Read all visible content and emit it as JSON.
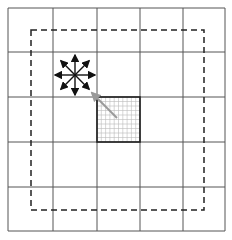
{
  "diagram": {
    "grid": {
      "rows": 5,
      "cols": 5,
      "x_lines": [
        8,
        53,
        97,
        140,
        183,
        225
      ],
      "y_lines": [
        8,
        52,
        97,
        142,
        187,
        231
      ],
      "line_color": "#555555"
    },
    "dashed_boundary": {
      "x1": 31,
      "y1": 30,
      "x2": 204,
      "y2": 210,
      "color": "#222222",
      "dash": "6,4"
    },
    "arrow_star": {
      "center": [
        75,
        75
      ],
      "length": 20,
      "directions": [
        "N",
        "NE",
        "E",
        "SE",
        "S",
        "SW",
        "W",
        "NW"
      ],
      "color": "#111111"
    },
    "highlighted_cell": {
      "row": 3,
      "col": 3,
      "x": 97,
      "y": 97,
      "w": 43,
      "h": 45,
      "subdivisions": 10,
      "subgrid_color": "#bbbbbb",
      "border_color": "#222222"
    },
    "pointer_arrow": {
      "from": [
        117,
        118
      ],
      "to": [
        92,
        93
      ],
      "color": "#999999"
    }
  }
}
